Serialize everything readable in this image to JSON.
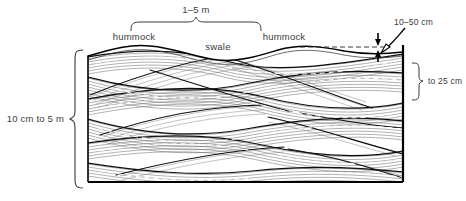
{
  "diagram": {
    "type": "geological-cross-section",
    "labels": {
      "wavelength": "1–5 m",
      "hummock_left": "hummock",
      "swale": "swale",
      "hummock_right": "hummock",
      "relief": "10–50 cm",
      "set_thickness": "to 25 cm",
      "bed_thickness": "10 cm to 5 m"
    },
    "colors": {
      "background": "#ffffff",
      "ink": "#000000",
      "text": "#3b3b3b",
      "laminae": "#2b2b2b",
      "fine_laminae": "#6d6d6d",
      "dashes": "#ffffff"
    },
    "block": {
      "left": 88,
      "right": 403,
      "top": 48,
      "bottom": 182
    },
    "measurements": [
      {
        "name": "wavelength",
        "value": "1–5 m",
        "axis": "horizontal",
        "position": "top"
      },
      {
        "name": "relief",
        "value": "10–50 cm",
        "axis": "vertical",
        "position": "top-right"
      },
      {
        "name": "set-thickness",
        "value": "to 25 cm",
        "axis": "vertical",
        "position": "right"
      },
      {
        "name": "bed-thickness",
        "value": "10 cm to 5 m",
        "axis": "vertical",
        "position": "left"
      }
    ]
  }
}
